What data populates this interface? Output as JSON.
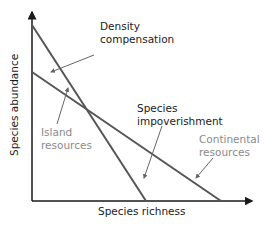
{
  "diagram": {
    "x_axis_label": "Species richness",
    "y_axis_label": "Species abundance",
    "labels": {
      "density_1": "Density",
      "density_2": "compensation",
      "island_1": "Island",
      "island_2": "resources",
      "impov_1": "Species",
      "impov_2": "impoverishment",
      "cont_1": "Continental",
      "cont_2": "resources"
    },
    "lines": [
      {
        "name": "island-resources-line",
        "from": [
          32,
          25
        ],
        "to": [
          146,
          201
        ]
      },
      {
        "name": "continental-resources-line",
        "from": [
          32,
          72
        ],
        "to": [
          221,
          201
        ]
      }
    ],
    "colors": {
      "axis": "#1a1a1a",
      "line": "#555555",
      "pointer": "#666666",
      "grey_label": "#8a8a8a"
    }
  }
}
